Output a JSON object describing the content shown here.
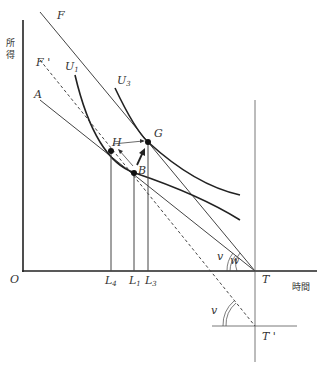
{
  "axes": {
    "y_label": "所得",
    "x_label": "時間",
    "origin": "O"
  },
  "lines": {
    "F": "F",
    "F_prime": "F '",
    "A": "A"
  },
  "curves": {
    "U1": {
      "base": "U",
      "sub": "1"
    },
    "U3": {
      "base": "U",
      "sub": "3"
    }
  },
  "points": {
    "G": "G",
    "H": "H",
    "B": "B",
    "T": "T",
    "T_prime": "T '"
  },
  "ticks": {
    "L4": {
      "base": "L",
      "sub": "4"
    },
    "L1": {
      "base": "L",
      "sub": "1"
    },
    "L3": {
      "base": "L",
      "sub": "3"
    }
  },
  "angles": {
    "v_upper": "v",
    "w": "w",
    "v_lower": "v"
  },
  "colors": {
    "stroke": "#222222",
    "thin": "#444444",
    "text": "#333333"
  }
}
